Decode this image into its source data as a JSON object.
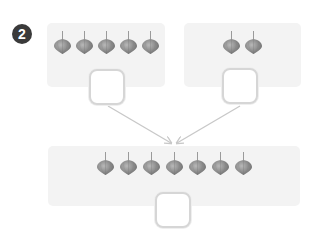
{
  "problem": {
    "number": "2",
    "icon": "spinning-top-icon",
    "icon_color": "#8c8c8c",
    "groups": [
      {
        "name": "left",
        "count": 5,
        "answer": ""
      },
      {
        "name": "right",
        "count": 2,
        "answer": ""
      }
    ],
    "total": {
      "count": 7,
      "answer": ""
    },
    "arrow_color": "#c8c8c8",
    "box_color": "#f3f3f3"
  }
}
